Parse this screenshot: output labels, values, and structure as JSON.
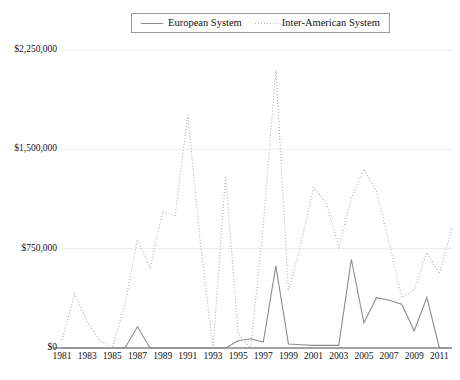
{
  "legend": {
    "position": "top-center",
    "entries": [
      {
        "label": "European System",
        "style": "solid",
        "color": "#8c8c8c",
        "icon": "solid-line-icon"
      },
      {
        "label": "Inter-American System",
        "style": "dotted",
        "color": "#b4b4b4",
        "icon": "dotted-line-icon"
      }
    ]
  },
  "axes": {
    "y_ticks": [
      "$0",
      "$750,000",
      "$1,500,000",
      "$2,250,000"
    ],
    "y_tick_values": [
      0,
      750000,
      1500000,
      2250000
    ],
    "x_ticks": [
      "1981",
      "1983",
      "1985",
      "1987",
      "1989",
      "1991",
      "1993",
      "1995",
      "1997",
      "1999",
      "2001",
      "2003",
      "2005",
      "2007",
      "2009",
      "2011"
    ]
  },
  "chart_data": {
    "type": "line",
    "title": "",
    "subtitle": "",
    "xlabel": "",
    "ylabel": "",
    "xlim": [
      1981,
      2012
    ],
    "ylim": [
      0,
      2250000
    ],
    "grid": true,
    "legend_position": "top-center",
    "x": [
      1981,
      1982,
      1983,
      1984,
      1985,
      1986,
      1987,
      1988,
      1989,
      1990,
      1991,
      1992,
      1993,
      1994,
      1995,
      1996,
      1997,
      1998,
      1999,
      2000,
      2001,
      2002,
      2003,
      2004,
      2005,
      2006,
      2007,
      2008,
      2009,
      2010,
      2011,
      2012
    ],
    "series": [
      {
        "name": "European System",
        "style": "solid",
        "color": "#8c8c8c",
        "values": [
          0,
          0,
          0,
          0,
          0,
          0,
          160000,
          0,
          0,
          0,
          0,
          0,
          0,
          0,
          55000,
          70000,
          45000,
          620000,
          30000,
          25000,
          20000,
          20000,
          20000,
          670000,
          190000,
          380000,
          360000,
          330000,
          130000,
          380000,
          0,
          0
        ]
      },
      {
        "name": "Inter-American System",
        "style": "dotted",
        "color": "#b4b4b4",
        "values": [
          60000,
          410000,
          200000,
          60000,
          0,
          330000,
          820000,
          600000,
          1030000,
          1000000,
          1760000,
          790000,
          0,
          1300000,
          110000,
          0,
          930000,
          2100000,
          430000,
          790000,
          1210000,
          1100000,
          760000,
          1130000,
          1350000,
          1180000,
          800000,
          380000,
          440000,
          720000,
          560000,
          910000
        ]
      }
    ]
  },
  "plot_geometry": {
    "left": 62,
    "right": 452,
    "top": 50,
    "bottom": 348
  }
}
